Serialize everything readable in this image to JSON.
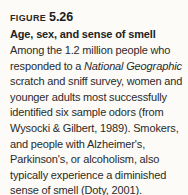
{
  "figure": {
    "label": "FIGURE",
    "number": "5.26",
    "subtitle": "Age, sex, and sense of smell",
    "body_part1": "Among the 1.2 million people who responded to a ",
    "body_italic": "National Geographic",
    "body_part2": " scratch and sniff survey, women and younger adults most successfully identified six sample odors (from Wysocki & Gilbert, 1989). Smokers, and people with Alzheimer's, Parkinson's, or alcoholism, also typically experience a diminished sense of smell (Doty, 2001).",
    "colors": {
      "background": "#fcfbf7",
      "text": "#2a2a2a",
      "heading": "#262626"
    }
  }
}
